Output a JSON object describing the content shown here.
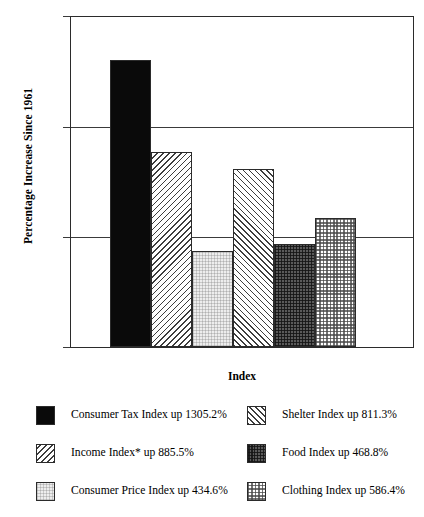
{
  "chart_data": {
    "type": "bar",
    "title": "",
    "xlabel": "Index",
    "ylabel": "Percentage Increase Since 1961",
    "ylim": [
      0,
      1500
    ],
    "yticks": [
      0,
      500,
      1000,
      1500
    ],
    "ytick_labels": [
      "0",
      "500",
      "1000",
      "1500"
    ],
    "grid": true,
    "legend_position": "below",
    "categories": [
      "Consumer Tax Index",
      "Income Index*",
      "Consumer Price Index",
      "Shelter Index",
      "Food Index",
      "Clothing Index"
    ],
    "values": [
      1305.2,
      885.5,
      434.6,
      811.3,
      468.8,
      586.4
    ],
    "bars": [
      {
        "category": "Consumer Tax Index",
        "value": 1305.2,
        "pattern": "solid-black",
        "legend_label": "Consumer Tax Index up 1305.2%"
      },
      {
        "category": "Income Index*",
        "value": 885.5,
        "pattern": "hatch-back",
        "legend_label": "Income Index* up 885.5%"
      },
      {
        "category": "Consumer Price Index",
        "value": 434.6,
        "pattern": "stipple-light",
        "legend_label": "Consumer Price Index up 434.6%"
      },
      {
        "category": "Shelter Index",
        "value": 811.3,
        "pattern": "hatch-fwd",
        "legend_label": "Shelter Index up 811.3%"
      },
      {
        "category": "Food Index",
        "value": 468.8,
        "pattern": "check-dark",
        "legend_label": "Food Index up 468.8%"
      },
      {
        "category": "Clothing Index",
        "value": 586.4,
        "pattern": "check-light",
        "legend_label": "Clothing Index up 586.4%"
      }
    ]
  },
  "axes": {
    "y_title": "Percentage Increase Since 1961",
    "x_title": "Index",
    "tick_1500": "1500",
    "tick_1000": "1000",
    "tick_500": "500",
    "tick_0": "0"
  },
  "legend": {
    "entries": [
      {
        "label": "Consumer Tax Index up 1305.2%",
        "pattern": "solid-black"
      },
      {
        "label": "Shelter Index up 811.3%",
        "pattern": "hatch-fwd"
      },
      {
        "label": "Income Index* up 885.5%",
        "pattern": "hatch-back"
      },
      {
        "label": "Food Index up 468.8%",
        "pattern": "check-dark"
      },
      {
        "label": "Consumer Price Index up 434.6%",
        "pattern": "stipple-light"
      },
      {
        "label": "Clothing Index up 586.4%",
        "pattern": "check-light"
      }
    ]
  },
  "colors": {
    "axis": "#2b2b2b",
    "gridline": "#3a3a3a",
    "bar_black": "#0a0a0a",
    "bar_dark_check": "#5a5a5a",
    "background": "#ffffff"
  }
}
